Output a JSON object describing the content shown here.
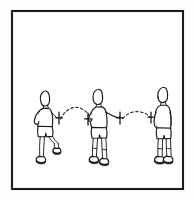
{
  "illustration": {
    "title": "Three-stage ball toss sequence line drawing",
    "alt_text": "Line art of a person in three poses tossing a small ball along dashed arcs",
    "style": "black-and-white pen line drawing",
    "background_color": "#ffffff",
    "ink_color": "#1a1a1a",
    "frame": {
      "name": "outer border",
      "shape": "rectangle",
      "stroke_color": "#1c1c1c",
      "stroke_width_px": 2,
      "x": 12,
      "y": 11,
      "width": 171,
      "height": 178
    },
    "figures": [
      {
        "id": "figure-left",
        "label": "Stage 1 - release",
        "facing": "right",
        "pose": "standing, weight on back leg, front knee lifted, arm swung back",
        "center_x": 47,
        "head_top_y": 90,
        "foot_y": 163
      },
      {
        "id": "figure-middle",
        "label": "Stage 2 - catch and re-toss",
        "facing": "right",
        "pose": "leaning forward, both arms low in front, knees slightly bent",
        "center_x": 100,
        "head_top_y": 88,
        "foot_y": 165
      },
      {
        "id": "figure-right",
        "label": "Stage 3 - receive",
        "facing": "left",
        "pose": "upright, arms at sides, feet together",
        "center_x": 158,
        "head_top_y": 86,
        "foot_y": 162
      }
    ],
    "trajectories": [
      {
        "id": "arc-1",
        "label": "first toss arc",
        "style": "dashed",
        "from_x": 60,
        "to_x": 92,
        "peak_y": 108,
        "base_y": 120
      },
      {
        "id": "arc-2",
        "label": "second toss arc",
        "style": "dashed",
        "from_x": 122,
        "to_x": 150,
        "peak_y": 112,
        "base_y": 119
      }
    ],
    "ball_markers": [
      {
        "id": "marker-1",
        "label": "ball at left hand",
        "x": 59,
        "y": 118
      },
      {
        "id": "marker-2",
        "label": "ball at middle figure left",
        "x": 88,
        "y": 119
      },
      {
        "id": "marker-3",
        "label": "ball at middle figure right",
        "x": 120,
        "y": 118
      },
      {
        "id": "marker-4",
        "label": "ball entering right arc",
        "x": 151,
        "y": 117
      }
    ]
  }
}
